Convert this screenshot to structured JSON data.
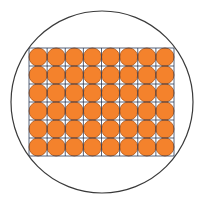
{
  "diagram": {
    "canvas": {
      "width": 205,
      "height": 204,
      "background": "#ffffff"
    },
    "outer_circle": {
      "cx": 102,
      "cy": 102,
      "r": 91,
      "stroke": "#3a3a3a",
      "stroke_width": 1.2
    },
    "grid": {
      "x": 29,
      "y": 48,
      "cols": 8,
      "rows": 6,
      "cell_w": 18.125,
      "cell_h": 18,
      "line_color": "#2b3a55",
      "line_width": 0.8
    },
    "small_circle": {
      "fill": "#f4822c",
      "stroke": "#b85a18",
      "stroke_width": 0.9,
      "count": 48
    }
  }
}
